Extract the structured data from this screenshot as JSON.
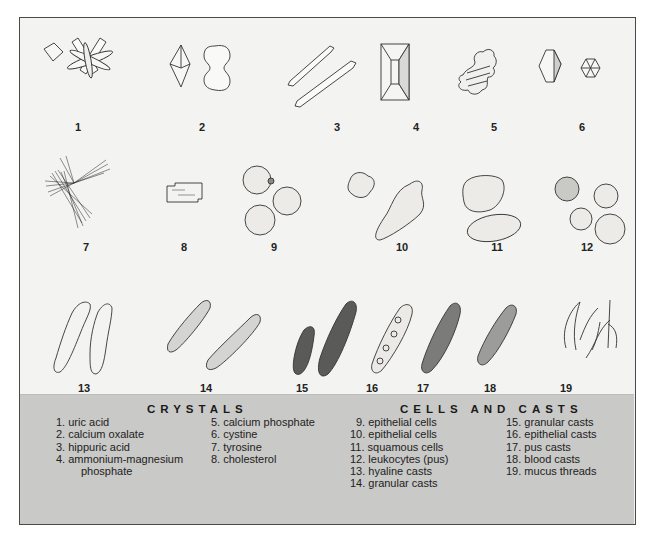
{
  "figure": {
    "numbers": [
      "1",
      "2",
      "3",
      "4",
      "5",
      "6",
      "7",
      "8",
      "9",
      "10",
      "11",
      "12",
      "13",
      "14",
      "15",
      "16",
      "17",
      "18",
      "19"
    ]
  },
  "legend": {
    "crystals": {
      "title": "CRYSTALS",
      "col1": [
        "1. uric acid",
        "2. calcium oxalate",
        "3. hippuric acid",
        "4. ammonium-magnesium"
      ],
      "col1_cont": "phosphate",
      "col2": [
        "5. calcium phosphate",
        "6. cystine",
        "7. tyrosine",
        "8. cholesterol"
      ]
    },
    "cells_and_casts": {
      "title": "CELLS AND CASTS",
      "col1": [
        "9. epithelial cells",
        "10. epithelial cells",
        "11. squamous cells",
        "12. leukocytes (pus)",
        "13. hyaline casts",
        "14. granular casts"
      ],
      "col2": [
        "15. granular casts",
        "16. epithelial casts",
        "17. pus casts",
        "18. blood casts",
        "19. mucus threads"
      ]
    }
  },
  "colors": {
    "illustration_bg": "#f3f3f1",
    "legend_bg": "#c9c9c7",
    "border": "#4a4a4a",
    "ink": "#222222"
  }
}
